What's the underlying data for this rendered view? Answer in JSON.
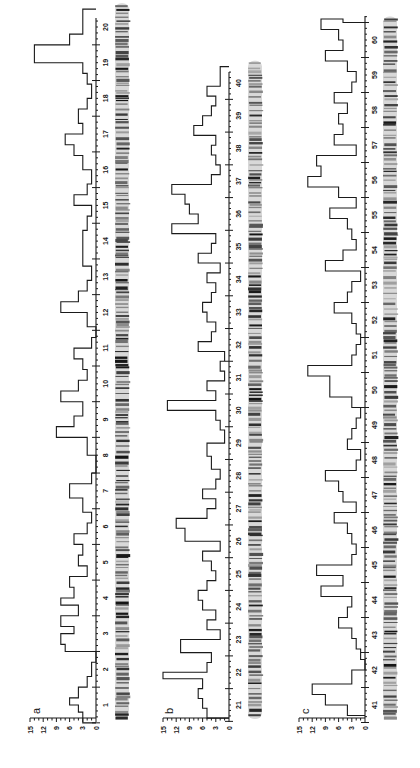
{
  "figure": {
    "orientation": "rotated-90-ccw",
    "panels": [
      {
        "label": "a",
        "div_start": 1,
        "div_end": 20
      },
      {
        "label": "b",
        "div_start": 21,
        "div_end": 40
      },
      {
        "label": "c",
        "div_start": 41,
        "div_end": 60
      }
    ],
    "scale_ticks": [
      "15",
      "12",
      "9",
      "6",
      "3",
      "0"
    ]
  },
  "chart_data": [
    {
      "type": "bar",
      "subtype": "step-histogram",
      "title": "a",
      "xlabel": "Chromosome division",
      "ylabel": "",
      "ylim": [
        0,
        15
      ],
      "yticks": [
        0,
        3,
        6,
        9,
        12,
        15
      ],
      "categories": [
        "1",
        "2",
        "3",
        "4",
        "5",
        "6",
        "7",
        "8",
        "9",
        "10",
        "11",
        "12",
        "13",
        "14",
        "15",
        "16",
        "17",
        "18",
        "19",
        "20"
      ],
      "x": [
        0.5,
        0.8,
        1.0,
        1.2,
        1.5,
        1.8,
        2.2,
        2.5,
        2.7,
        3.0,
        3.2,
        3.5,
        3.8,
        4.0,
        4.3,
        4.6,
        4.9,
        5.2,
        5.5,
        5.8,
        6.1,
        6.4,
        6.8,
        7.2,
        7.5,
        8.0,
        8.5,
        8.8,
        9.1,
        9.5,
        9.8,
        10.1,
        10.4,
        10.7,
        11.0,
        11.3,
        11.6,
        12.0,
        12.3,
        12.6,
        12.9,
        13.3,
        13.8,
        14.3,
        14.7,
        15.0,
        15.3,
        15.6,
        16.0,
        16.4,
        16.7,
        17.0,
        17.3,
        17.7,
        18.0,
        18.4,
        18.7,
        19.0,
        19.5,
        19.8
      ],
      "values": [
        3,
        4,
        6,
        4,
        2,
        1,
        0,
        7,
        8,
        5,
        8,
        4,
        8,
        5,
        6,
        2,
        4,
        3,
        5,
        2,
        1,
        3,
        6,
        1,
        0,
        2,
        9,
        5,
        3,
        8,
        4,
        2,
        3,
        5,
        1,
        0,
        2,
        8,
        4,
        2,
        1,
        3,
        3,
        2,
        1,
        5,
        2,
        1,
        3,
        5,
        7,
        3,
        4,
        2,
        1,
        2,
        3,
        14,
        6,
        3
      ],
      "note": "values estimated from step outline; rounded"
    },
    {
      "type": "bar",
      "subtype": "step-histogram",
      "title": "b",
      "xlabel": "Chromosome division",
      "ylabel": "",
      "ylim": [
        0,
        15
      ],
      "yticks": [
        0,
        3,
        6,
        9,
        12,
        15
      ],
      "categories": [
        "21",
        "22",
        "23",
        "24",
        "25",
        "26",
        "27",
        "28",
        "29",
        "30",
        "31",
        "32",
        "33",
        "34",
        "35",
        "36",
        "37",
        "38",
        "39",
        "40"
      ],
      "x": [
        20.6,
        20.9,
        21.2,
        21.5,
        21.8,
        22.0,
        22.3,
        22.6,
        23.0,
        23.3,
        23.6,
        23.9,
        24.2,
        24.5,
        24.8,
        25.1,
        25.4,
        25.7,
        26.0,
        26.4,
        26.7,
        27.0,
        27.3,
        27.6,
        27.9,
        28.2,
        28.6,
        29.0,
        29.4,
        29.7,
        30.0,
        30.3,
        30.6,
        30.9,
        31.2,
        31.5,
        31.8,
        32.1,
        32.4,
        32.7,
        33.0,
        33.3,
        33.6,
        33.9,
        34.2,
        34.5,
        34.8,
        35.1,
        35.4,
        35.7,
        36.0,
        36.3,
        36.6,
        36.9,
        37.2,
        37.5,
        37.8,
        38.1,
        38.4,
        38.7,
        39.0,
        39.3,
        39.6,
        39.9
      ],
      "values": [
        5,
        6,
        7,
        6,
        15,
        5,
        4,
        11,
        2,
        5,
        3,
        6,
        7,
        5,
        3,
        4,
        6,
        2,
        10,
        12,
        5,
        3,
        6,
        3,
        2,
        4,
        5,
        1,
        2,
        3,
        14,
        3,
        5,
        1,
        2,
        1,
        7,
        4,
        3,
        5,
        6,
        4,
        3,
        5,
        2,
        7,
        4,
        3,
        13,
        7,
        9,
        10,
        13,
        4,
        2,
        3,
        4,
        3,
        8,
        6,
        4,
        3,
        5,
        2
      ],
      "note": "values estimated from step outline; rounded"
    },
    {
      "type": "bar",
      "subtype": "step-histogram",
      "title": "c",
      "xlabel": "Chromosome division",
      "ylabel": "",
      "ylim": [
        0,
        15
      ],
      "yticks": [
        0,
        3,
        6,
        9,
        12,
        15
      ],
      "categories": [
        "41",
        "42",
        "43",
        "44",
        "45",
        "46",
        "47",
        "48",
        "49",
        "50",
        "51",
        "52",
        "53",
        "54",
        "55",
        "56",
        "57",
        "58",
        "59",
        "60"
      ],
      "x": [
        40.7,
        41.0,
        41.3,
        41.6,
        42.0,
        42.3,
        42.6,
        42.9,
        43.2,
        43.5,
        43.8,
        44.1,
        44.4,
        44.7,
        45.0,
        45.3,
        45.6,
        45.9,
        46.2,
        46.5,
        46.8,
        47.1,
        47.4,
        47.7,
        48.0,
        48.3,
        48.6,
        48.9,
        49.2,
        49.5,
        49.8,
        50.4,
        50.7,
        51.0,
        51.3,
        51.6,
        51.9,
        52.2,
        52.5,
        52.8,
        53.1,
        53.4,
        53.7,
        54.0,
        54.3,
        54.6,
        54.9,
        55.2,
        55.5,
        55.8,
        56.1,
        56.4,
        56.7,
        57.0,
        57.3,
        57.6,
        57.9,
        58.2,
        58.5,
        58.8,
        59.1,
        59.4,
        59.7,
        60.0,
        60.3,
        60.6
      ],
      "values": [
        4,
        9,
        12,
        3,
        0,
        1,
        2,
        3,
        6,
        4,
        3,
        10,
        5,
        11,
        3,
        2,
        3,
        4,
        7,
        2,
        5,
        6,
        9,
        2,
        1,
        4,
        3,
        2,
        1,
        3,
        8,
        13,
        3,
        2,
        1,
        2,
        3,
        7,
        4,
        3,
        1,
        9,
        5,
        2,
        3,
        4,
        8,
        2,
        6,
        13,
        10,
        11,
        2,
        7,
        5,
        6,
        4,
        7,
        3,
        2,
        4,
        9,
        5,
        6,
        10,
        5
      ],
      "note": "values estimated from step outline; rounded"
    }
  ]
}
